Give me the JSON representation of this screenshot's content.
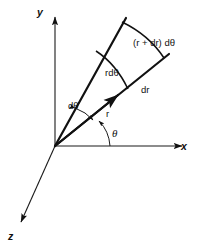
{
  "figure": {
    "background_color": "#ffffff",
    "line_color": "#111111"
  },
  "axes": {
    "x": {
      "label": "x",
      "arrow": "right",
      "origin": [
        55,
        146
      ],
      "end": [
        185,
        146
      ]
    },
    "y": {
      "label": "y",
      "arrow": "up",
      "origin": [
        55,
        146
      ],
      "end": [
        55,
        14
      ]
    },
    "z": {
      "label": "z",
      "arrow": "down-left",
      "origin": [
        55,
        146
      ],
      "end": [
        18,
        228
      ]
    }
  },
  "rays": {
    "upper": {
      "name": "theta-plus-dtheta-ray",
      "from": [
        55,
        146
      ],
      "to": [
        125,
        19
      ]
    },
    "radial": {
      "name": "r-ray",
      "from": [
        55,
        146
      ],
      "to": [
        168,
        55
      ],
      "arrow": true
    }
  },
  "arcs": {
    "inner": {
      "name": "inner-arc-rdtheta",
      "from": [
        96,
        51
      ],
      "to": [
        128,
        89
      ]
    },
    "outer": {
      "name": "outer-arc-r-plus-dr-dtheta",
      "from": [
        122,
        22
      ],
      "to": [
        164,
        58
      ]
    },
    "dtheta": {
      "name": "dtheta-angle-arc",
      "double_headed": true
    },
    "theta": {
      "name": "theta-angle-arc",
      "arrow": true
    }
  },
  "labels": {
    "axis_x": "x",
    "axis_y": "y",
    "axis_z": "z",
    "outer_arc": "(r + dr) dθ",
    "inner_arc": "rdθ",
    "radial_outer": "dr",
    "radial_inner": "r",
    "angle_element": "dθ",
    "angle_theta": "θ"
  }
}
